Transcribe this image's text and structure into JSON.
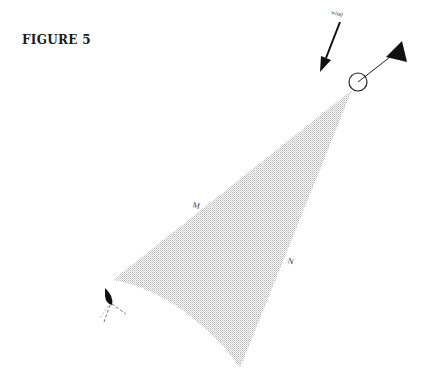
{
  "figure": {
    "title": "FIGURE 5",
    "wind_label": "wind",
    "labels": {
      "m": "M",
      "n": "N"
    },
    "colors": {
      "ink": "#111111",
      "shade": "#c8c8c8"
    }
  }
}
